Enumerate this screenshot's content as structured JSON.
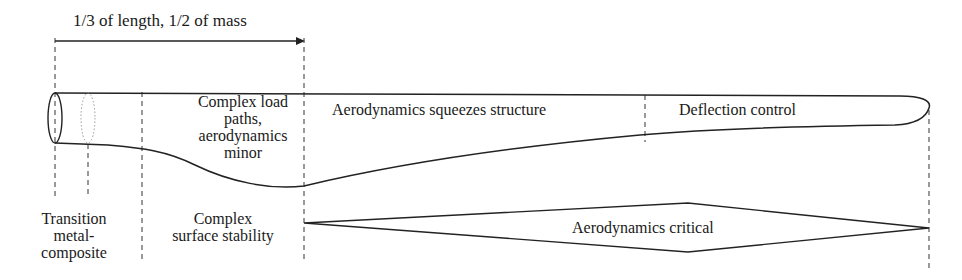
{
  "title_arrow": {
    "label": "1/3 of length, 1/2 of mass"
  },
  "blade_regions": [
    {
      "id": "root",
      "label_lines": [
        "Complex load",
        "paths,",
        "aerodynamics",
        "minor"
      ]
    },
    {
      "id": "mid",
      "label": "Aerodynamics squeezes structure"
    },
    {
      "id": "tip",
      "label": "Deflection control"
    }
  ],
  "bottom_labels": {
    "transition": [
      "Transition",
      "metal-",
      "composite"
    ],
    "surface": [
      "Complex",
      "surface stability"
    ],
    "aero_critical": "Aerodynamics critical"
  },
  "colors": {
    "line": "#222222",
    "dashed": "#333333",
    "dotted": "#999999",
    "background": "#ffffff"
  }
}
